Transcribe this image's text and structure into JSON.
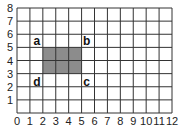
{
  "chart_data": {
    "type": "diagram-grid",
    "title": "",
    "x_ticks": [
      "0",
      "1",
      "2",
      "3",
      "4",
      "5",
      "6",
      "7",
      "8",
      "9",
      "10",
      "11",
      "12"
    ],
    "y_ticks": [
      "1",
      "2",
      "3",
      "4",
      "5",
      "6",
      "7",
      "8"
    ],
    "xlim": [
      0,
      12
    ],
    "ylim": [
      0,
      8
    ],
    "grid": true,
    "shaded_rectangle": {
      "x0": 2,
      "y0": 3,
      "x1": 5,
      "y1": 5,
      "color": "#8c8c8c"
    },
    "corner_labels": [
      {
        "label": "a",
        "x": 2,
        "y": 5,
        "position": "top-left"
      },
      {
        "label": "b",
        "x": 5,
        "y": 5,
        "position": "top-right"
      },
      {
        "label": "c",
        "x": 5,
        "y": 3,
        "position": "bottom-right"
      },
      {
        "label": "d",
        "x": 2,
        "y": 3,
        "position": "bottom-left"
      }
    ]
  },
  "colors": {
    "grid": "#333333",
    "shade": "#8c8c8c"
  }
}
